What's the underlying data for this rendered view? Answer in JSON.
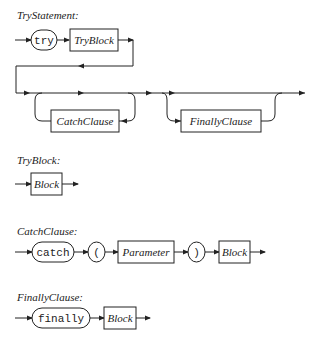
{
  "rules": [
    {
      "name": "TryStatement:",
      "elements": [
        {
          "kind": "terminal",
          "text": "try"
        },
        {
          "kind": "nonterminal",
          "text": "TryBlock"
        },
        {
          "kind": "optional-repeat-nonterminal",
          "text": "CatchClause"
        },
        {
          "kind": "optional-nonterminal",
          "text": "FinallyClause"
        }
      ]
    },
    {
      "name": "TryBlock:",
      "elements": [
        {
          "kind": "nonterminal",
          "text": "Block"
        }
      ]
    },
    {
      "name": "CatchClause:",
      "elements": [
        {
          "kind": "terminal",
          "text": "catch"
        },
        {
          "kind": "terminal",
          "text": "("
        },
        {
          "kind": "nonterminal",
          "text": "Parameter"
        },
        {
          "kind": "terminal",
          "text": ")"
        },
        {
          "kind": "nonterminal",
          "text": "Block"
        }
      ]
    },
    {
      "name": "FinallyClause:",
      "elements": [
        {
          "kind": "terminal",
          "text": "finally"
        },
        {
          "kind": "nonterminal",
          "text": "Block"
        }
      ]
    }
  ],
  "colors": {
    "line": "#222222",
    "background": "#ffffff"
  }
}
